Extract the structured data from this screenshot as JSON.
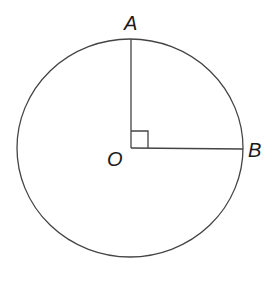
{
  "diagram": {
    "type": "circle-with-right-angle",
    "center_label": "O",
    "points": [
      {
        "label": "A",
        "position": "top of circle"
      },
      {
        "label": "B",
        "position": "right of circle"
      }
    ],
    "segments": [
      "OA",
      "OB"
    ],
    "right_angle_at": "O",
    "colors": {
      "stroke": "#444444",
      "text": "#1a1a1a",
      "background": "#ffffff"
    }
  }
}
